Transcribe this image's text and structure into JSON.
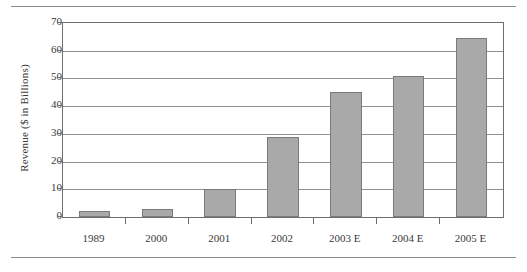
{
  "chart_data": {
    "type": "bar",
    "title": "",
    "subtitle": "",
    "xlabel": "",
    "ylabel": "Revenue ($ in Billions)",
    "categories": [
      "1989",
      "2000",
      "2001",
      "2002",
      "2003 E",
      "2004 E",
      "2005 E"
    ],
    "values": [
      2,
      3,
      10,
      29,
      45,
      51,
      64.5
    ],
    "ylim": [
      0,
      70
    ],
    "yticks": [
      0,
      10,
      20,
      30,
      40,
      50,
      60,
      70
    ],
    "ytick_labels": [
      "0",
      "10",
      "20",
      "30",
      "40",
      "50",
      "60",
      "70"
    ],
    "grid": true,
    "legend": false,
    "legend_position": "none",
    "series": [
      {
        "name": "Revenue",
        "values": [
          2,
          3,
          10,
          29,
          45,
          51,
          64.5
        ]
      }
    ],
    "colors": {
      "bar_fill": "#a9a9a9",
      "bar_border": "#7a7a7a",
      "gridline": "#8f8f8f",
      "axis": "#6e6e6e",
      "text": "#3a3a3a",
      "rule": "#8c8c8c",
      "background": "#ffffff"
    }
  },
  "figure": {
    "top_rule": "",
    "bottom_rule": ""
  }
}
